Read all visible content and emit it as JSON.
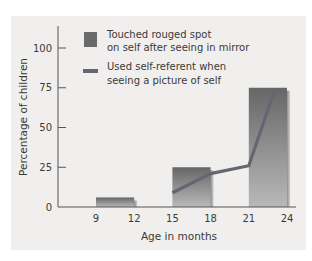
{
  "chart_data": {
    "type": "bar",
    "title": "",
    "xlabel": "Age in months",
    "ylabel": "Percentage of children",
    "ylim": [
      0,
      100
    ],
    "xlim": [
      6,
      25
    ],
    "y_ticks": [
      0,
      25,
      50,
      75,
      100
    ],
    "x_ticks": [
      9,
      12,
      15,
      18,
      21,
      24
    ],
    "grid": false,
    "legend_position": "top-left inside",
    "series": [
      {
        "name": "Touched rouged spot on self after seeing in mirror",
        "type": "bar",
        "color": "#6b6b6b",
        "bins": [
          {
            "from": 9,
            "to": 12,
            "value": 6
          },
          {
            "from": 15,
            "to": 18,
            "value": 25
          },
          {
            "from": 21,
            "to": 24,
            "value": 75
          }
        ]
      },
      {
        "name": "Used self-referent when seeing a picture of self",
        "type": "line",
        "color": "#6a6a78",
        "points": [
          {
            "x": 15,
            "y": 9
          },
          {
            "x": 18,
            "y": 21
          },
          {
            "x": 21,
            "y": 26
          },
          {
            "x": 23,
            "y": 73
          }
        ]
      }
    ]
  },
  "legend": {
    "bar_label_line1": "Touched rouged spot",
    "bar_label_line2": "on self after seeing in mirror",
    "line_label_line1": "Used self-referent when",
    "line_label_line2": "seeing a picture of self"
  },
  "axes": {
    "y_title": "Percentage of children",
    "x_title": "Age in months",
    "y_labels": [
      "0",
      "25",
      "50",
      "75",
      "100"
    ],
    "x_labels": [
      "9",
      "12",
      "15",
      "18",
      "21",
      "24"
    ]
  }
}
